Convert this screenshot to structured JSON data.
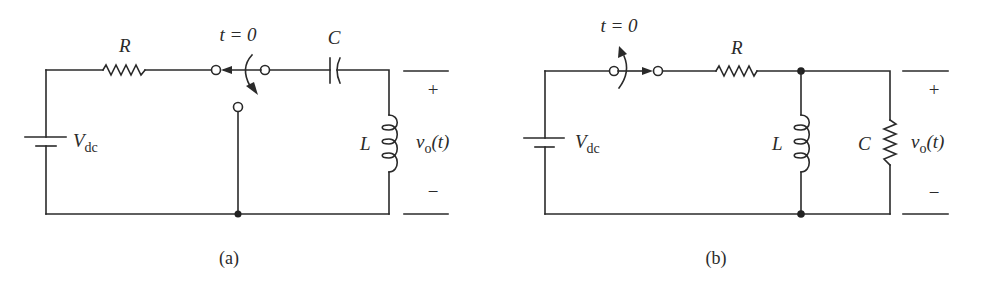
{
  "figure": {
    "background": "#ffffff",
    "ink_color": "#2a2a2a",
    "panels": [
      {
        "id": "a",
        "caption": "(a)",
        "topology": "Vdc source in series with R; SPDT switch at t = 0 flips from R-path to ground, leaving series C–L loop; output across L",
        "labels": {
          "resistor": "R",
          "capacitor": "C",
          "inductor": "L",
          "source_main": "V",
          "source_sub": "dc",
          "switch_time": "t = 0",
          "output_main": "v",
          "output_sub": "o",
          "output_arg": "(t)",
          "plus": "+",
          "minus": "−"
        }
      },
      {
        "id": "b",
        "caption": "(b)",
        "topology": "Vdc source with switch closing at t = 0, series R, feeding parallel L and C; output across parallel combination",
        "labels": {
          "resistor": "R",
          "capacitor": "C",
          "inductor": "L",
          "source_main": "V",
          "source_sub": "dc",
          "switch_time": "t = 0",
          "output_main": "v",
          "output_sub": "o",
          "output_arg": "(t)",
          "plus": "+",
          "minus": "−"
        }
      }
    ]
  }
}
